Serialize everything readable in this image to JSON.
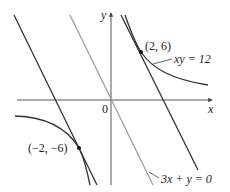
{
  "figure": {
    "type": "diagram",
    "axes": {
      "x_label": "x",
      "y_label": "y",
      "origin_label": "0"
    },
    "curves": [
      {
        "name": "hyperbola",
        "label": "xy = 12",
        "equation": "xy = 12",
        "color": "#333333"
      },
      {
        "name": "reference-line",
        "label": "3x + y = 0",
        "equation": "y = -3x",
        "color": "#999999"
      },
      {
        "name": "tangent-upper",
        "equation": "y = -3x + 12",
        "color": "#333333"
      },
      {
        "name": "tangent-lower",
        "equation": "y = -3x - 12",
        "color": "#333333"
      }
    ],
    "points": [
      {
        "label": "(2, 6)",
        "x": 2,
        "y": 6
      },
      {
        "label": "(−2, −6)",
        "x": -2,
        "y": -6
      }
    ],
    "colors": {
      "dark_line": "#333333",
      "gray_line": "#9a9a9a",
      "axis": "#444444",
      "background": "#ffffff"
    }
  }
}
